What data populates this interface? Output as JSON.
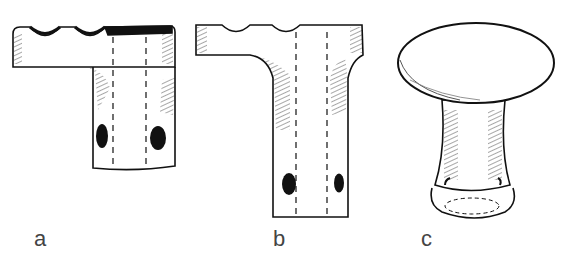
{
  "figure": {
    "panels": [
      {
        "id": "a",
        "label": "a",
        "description": "T-shaped handle with off-center stem, notched top bar with dark top band, two oval holes and internal dashed bore"
      },
      {
        "id": "b",
        "label": "b",
        "description": "T-shaped handle with centered stem, two notches on top bar, flared neck, two oval holes and internal dashed bore"
      },
      {
        "id": "c",
        "label": "c",
        "description": "Mushroom-shaped knob with oval cap, narrowing neck and rounded base"
      }
    ],
    "colors": {
      "line": "#111111",
      "background": "#ffffff",
      "label": "#444444"
    }
  }
}
